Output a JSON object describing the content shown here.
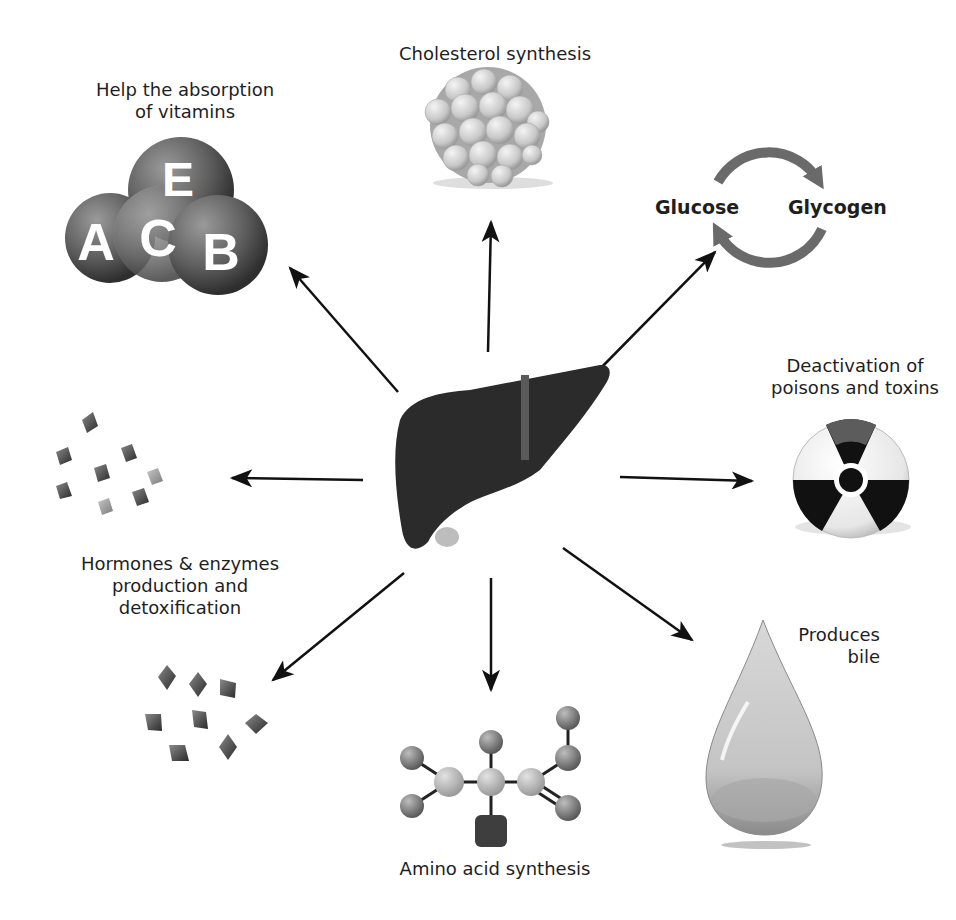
{
  "diagram": {
    "center": "Liver",
    "functions": [
      {
        "id": "vitamins",
        "label_line1": "Help the absorption",
        "label_line2": "of vitamins",
        "icon": "vitamin-spheres",
        "letters": [
          "E",
          "A",
          "C",
          "B"
        ]
      },
      {
        "id": "cholesterol",
        "label": "Cholesterol synthesis",
        "icon": "cholesterol-cluster"
      },
      {
        "id": "glycogen",
        "left": "Glucose",
        "right": "Glycogen",
        "icon": "cycle-arrows"
      },
      {
        "id": "toxins",
        "label_line1": "Deactivation of",
        "label_line2": "poisons and toxins",
        "icon": "radiation-symbol"
      },
      {
        "id": "bile",
        "label_line1": "Produces",
        "label_line2": "bile",
        "icon": "bile-drop"
      },
      {
        "id": "amino",
        "label": "Amino acid synthesis",
        "icon": "molecule"
      },
      {
        "id": "hormones",
        "label_line1": "Hormones & enzymes",
        "label_line2": "production and",
        "label_line3": "detoxification",
        "icon": "crystals"
      }
    ]
  }
}
